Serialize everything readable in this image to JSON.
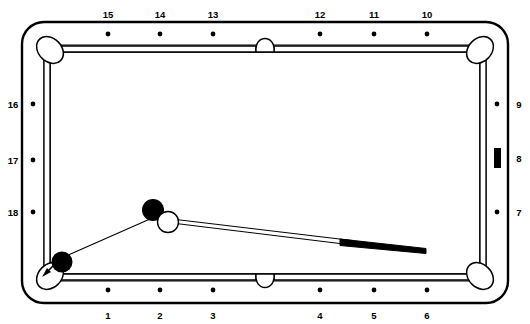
{
  "diagram": {
    "type": "billiard-table-layout",
    "table": {
      "rail_color": "#ffffff",
      "cushion_color": "#ffffff",
      "outline_color": "#000000",
      "cloth_color": "#ffffff"
    },
    "diamond_labels": {
      "top": [
        "15",
        "14",
        "13",
        "12",
        "11",
        "10"
      ],
      "bottom": [
        "1",
        "2",
        "3",
        "4",
        "5",
        "6"
      ],
      "left": [
        "16",
        "17",
        "18"
      ],
      "right": [
        "9",
        "8",
        "7"
      ]
    },
    "pockets": [
      {
        "name": "top-left-corner-pocket",
        "type": "corner"
      },
      {
        "name": "top-side-pocket",
        "type": "side"
      },
      {
        "name": "top-right-corner-pocket",
        "type": "corner"
      },
      {
        "name": "bottom-left-corner-pocket",
        "type": "corner"
      },
      {
        "name": "bottom-side-pocket",
        "type": "side"
      },
      {
        "name": "bottom-right-corner-pocket",
        "type": "corner"
      }
    ],
    "balls": [
      {
        "name": "object-ball-upper",
        "color": "#000000",
        "x": 153,
        "y": 210,
        "r": 11
      },
      {
        "name": "cue-ball",
        "color": "#ffffff",
        "x": 168,
        "y": 222,
        "r": 10.5
      },
      {
        "name": "object-ball-pocket",
        "color": "#000000",
        "x": 62,
        "y": 262,
        "r": 10.5
      }
    ],
    "cue_stick": {
      "name": "cue-stick",
      "tip_x": 176,
      "tip_y": 221,
      "butt_x": 426,
      "butt_y": 250,
      "shaft_color": "#ffffff",
      "butt_color": "#000000"
    },
    "aim_line": {
      "name": "aim-line",
      "from_x": 150,
      "from_y": 219,
      "to_x": 66,
      "to_y": 256,
      "color": "#000000"
    },
    "pocket_arrow": {
      "name": "pocket-arrow",
      "direction": "down-left",
      "target": "bottom-left-corner-pocket"
    },
    "rail_marker": {
      "name": "right-rail-marker",
      "shape": "filled-rectangle",
      "color": "#000000",
      "near_label": "8"
    }
  }
}
